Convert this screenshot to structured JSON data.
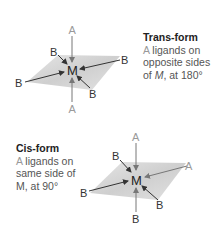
{
  "trans": {
    "title": "Trans-form",
    "desc_a": "A",
    "desc_rest1": " ligands on",
    "desc_line2": "opposite sides",
    "desc_line3_pre": "of ",
    "desc_line3_m": "M",
    "desc_line3_post": ", at 180°",
    "labels": {
      "center": "M",
      "a_top": "A",
      "a_bottom": "A",
      "b_upper_left": "B",
      "b_right": "B",
      "b_left": "B",
      "b_lower_right": "B"
    }
  },
  "cis": {
    "title": "Cis-form",
    "desc_a": "A",
    "desc_rest1": " ligands on",
    "desc_line2": "same side of",
    "desc_line3": "M, at 90°",
    "labels": {
      "center": "M",
      "a_top": "A",
      "a_right": "A",
      "b_upper_left": "B",
      "b_left": "B",
      "b_lower_right": "B",
      "b_bottom": "B"
    }
  },
  "colors": {
    "plane": "#d4d4d4",
    "ligand_a": "#9a9a9a",
    "ligand_b": "#333333",
    "arrow": "#333333",
    "arrow_a": "#777777"
  }
}
